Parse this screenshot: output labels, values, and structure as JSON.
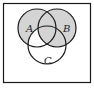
{
  "diagram": {
    "type": "venn",
    "sets": [
      {
        "label": "A"
      },
      {
        "label": "B"
      },
      {
        "label": "C"
      }
    ],
    "shaded_regions": [
      "A only",
      "B only",
      "A∩B only",
      "A∩B∩C",
      "B∩C only"
    ],
    "unshaded_regions": [
      "C only",
      "A∩C only",
      "outside"
    ],
    "colors": {
      "shade": "#d4d4d4",
      "stroke": "#1a1a1a",
      "background": "#ffffff"
    }
  }
}
